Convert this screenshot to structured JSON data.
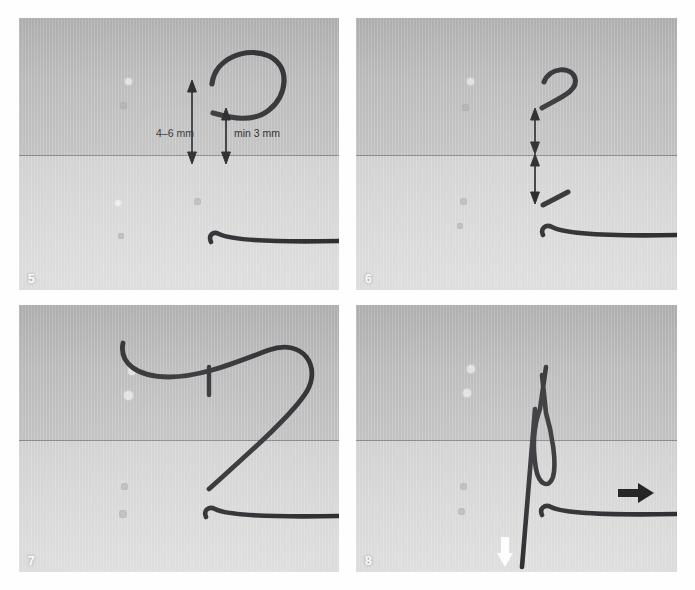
{
  "figure": {
    "kind": "photographic-instruction-sequence",
    "canvas": {
      "width": 695,
      "height": 590,
      "background": "#fefefe"
    },
    "colors": {
      "suture_thread": "#2d2d31",
      "tissue_upper": "#b3b3b3",
      "tissue_lower": "#d6d6d6",
      "wound_line": "#6f7276",
      "annotation_black": "#1d1d20",
      "annotation_white": "#fdfdfd",
      "panel_number": "#fdfdfd"
    },
    "panels": [
      {
        "number": "5",
        "rect": {
          "x": 19,
          "y": 18,
          "w": 320,
          "h": 272
        },
        "annotations": [
          {
            "kind": "dimension-label",
            "text": "4–6 mm"
          },
          {
            "kind": "dimension-label",
            "text": "min 3 mm"
          },
          {
            "kind": "double-arrow",
            "name": "long-depth-arrow"
          },
          {
            "kind": "double-arrow",
            "name": "short-depth-arrow"
          }
        ],
        "elements": [
          "curved-needle-loop",
          "horizontal-suture-strand",
          "wound-edge-line"
        ]
      },
      {
        "number": "6",
        "rect": {
          "x": 356,
          "y": 18,
          "w": 321,
          "h": 272
        },
        "annotations": [
          {
            "kind": "double-arrow",
            "name": "symmetry-arrow-upper"
          },
          {
            "kind": "double-arrow",
            "name": "symmetry-arrow-lower"
          }
        ],
        "elements": [
          "short-hook-thread",
          "short-diagonal-thread",
          "horizontal-suture-strand",
          "wound-edge-line"
        ]
      },
      {
        "number": "7",
        "rect": {
          "x": 19,
          "y": 305,
          "w": 320,
          "h": 267
        },
        "annotations": [],
        "elements": [
          "long-thread-loop",
          "thread-crossing-stub",
          "horizontal-suture-strand",
          "wound-edge-line"
        ]
      },
      {
        "number": "8",
        "rect": {
          "x": 356,
          "y": 305,
          "w": 321,
          "h": 267
        },
        "annotations": [
          {
            "kind": "arrow",
            "name": "pull-right-arrow",
            "color": "#1d1d20",
            "direction": "right"
          },
          {
            "kind": "arrow",
            "name": "pull-down-arrow",
            "color": "#fdfdfd",
            "direction": "down"
          }
        ],
        "elements": [
          "knot-loop",
          "vertical-thread-tail",
          "horizontal-suture-strand",
          "wound-edge-line"
        ]
      }
    ]
  }
}
